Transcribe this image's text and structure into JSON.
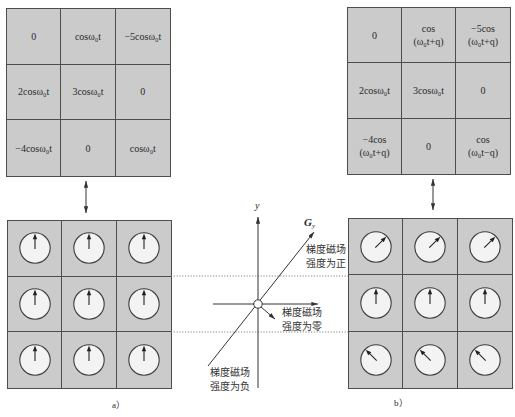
{
  "panel_a": {
    "label": "a）",
    "signal_matrix": [
      [
        {
          "line1": "0"
        },
        {
          "line1": "cosω₀t"
        },
        {
          "line1": "−5cosω₀t"
        }
      ],
      [
        {
          "line1": "2cosω₀t"
        },
        {
          "line1": "3cosω₀t"
        },
        {
          "line1": "0"
        }
      ],
      [
        {
          "line1": "−4cosω₀t"
        },
        {
          "line1": "0"
        },
        {
          "line1": "cosω₀t"
        }
      ]
    ],
    "spin_phase_deg": [
      [
        0,
        0,
        0
      ],
      [
        0,
        0,
        0
      ],
      [
        0,
        0,
        0
      ]
    ]
  },
  "panel_b": {
    "label": "b）",
    "signal_matrix": [
      [
        {
          "line1": "0"
        },
        {
          "line1": "cos",
          "line2": "(ω₀t+q)"
        },
        {
          "line1": "−5cos",
          "line2": "(ω₀t+q)"
        }
      ],
      [
        {
          "line1": "2cosω₀t"
        },
        {
          "line1": "3cosω₀t"
        },
        {
          "line1": "0"
        }
      ],
      [
        {
          "line1": "−4cos",
          "line2": "(ω₀t+q)"
        },
        {
          "line1": "0"
        },
        {
          "line1": "cos",
          "line2": "(ω₀t−q)"
        }
      ]
    ],
    "spin_phase_deg": [
      [
        45,
        45,
        45
      ],
      [
        0,
        0,
        0
      ],
      [
        -45,
        -45,
        -45
      ]
    ]
  },
  "center": {
    "y_axis_label": "y",
    "gradient_label": "G",
    "gradient_subscript": "y",
    "label_positive": [
      "梯度磁场",
      "强度为正"
    ],
    "label_zero": [
      "梯度磁场",
      "强度为零"
    ],
    "label_negative": [
      "梯度磁场",
      "强度为负"
    ]
  },
  "colors": {
    "cell_background": "#cbcbcb",
    "grid_line": "#4d4d4d",
    "dial_fill": "#f3f3f3",
    "ink": "#2a2a2a"
  },
  "icons": {
    "spin_vector": "arrow-in-circle",
    "correspondence": "double-headed-arrow"
  }
}
